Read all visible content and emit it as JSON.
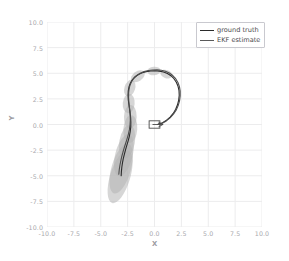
{
  "chart_data": {
    "type": "line",
    "title": "",
    "xlabel": "X",
    "ylabel": "Y",
    "xlim": [
      -10.0,
      10.0
    ],
    "ylim": [
      -10.0,
      10.0
    ],
    "xticks": [
      "-10.0",
      "-7.5",
      "-5.0",
      "-2.5",
      "0.0",
      "2.5",
      "5.0",
      "7.5",
      "10.0"
    ],
    "xtick_values": [
      -10.0,
      -7.5,
      -5.0,
      -2.5,
      0.0,
      2.5,
      5.0,
      7.5,
      10.0
    ],
    "yticks": [
      "10.0",
      "7.5",
      "5.0",
      "2.5",
      "0.0",
      "-2.5",
      "-5.0",
      "-7.5",
      "-10.0"
    ],
    "ytick_values": [
      10.0,
      7.5,
      5.0,
      2.5,
      0.0,
      -2.5,
      -5.0,
      -7.5,
      -10.0
    ],
    "grid": true,
    "grid_color": "#ececed",
    "background": "#ffffff",
    "legend_position": "upper right",
    "series": [
      {
        "name": "ground truth",
        "color": "#2b2b2b",
        "linewidth": 1.1,
        "points": [
          [
            0.35,
            0.05
          ],
          [
            0.75,
            0.18
          ],
          [
            1.12,
            0.42
          ],
          [
            1.45,
            0.72
          ],
          [
            1.74,
            1.08
          ],
          [
            1.97,
            1.48
          ],
          [
            2.14,
            1.92
          ],
          [
            2.25,
            2.38
          ],
          [
            2.3,
            2.85
          ],
          [
            2.28,
            3.3
          ],
          [
            2.19,
            3.73
          ],
          [
            2.03,
            4.12
          ],
          [
            1.81,
            4.47
          ],
          [
            1.53,
            4.76
          ],
          [
            1.2,
            4.98
          ],
          [
            0.84,
            5.13
          ],
          [
            0.45,
            5.21
          ],
          [
            0.05,
            5.24
          ],
          [
            -0.36,
            5.22
          ],
          [
            -0.76,
            5.16
          ],
          [
            -1.14,
            5.05
          ],
          [
            -1.49,
            4.88
          ],
          [
            -1.8,
            4.66
          ],
          [
            -2.05,
            4.38
          ],
          [
            -2.24,
            4.05
          ],
          [
            -2.37,
            3.68
          ],
          [
            -2.44,
            3.28
          ],
          [
            -2.46,
            2.86
          ],
          [
            -2.44,
            2.43
          ],
          [
            -2.39,
            2.0
          ],
          [
            -2.33,
            1.57
          ],
          [
            -2.27,
            1.13
          ],
          [
            -2.22,
            0.68
          ],
          [
            -2.2,
            0.22
          ],
          [
            -2.21,
            -0.24
          ],
          [
            -2.26,
            -0.7
          ],
          [
            -2.34,
            -1.15
          ],
          [
            -2.45,
            -1.59
          ],
          [
            -2.57,
            -2.02
          ],
          [
            -2.69,
            -2.45
          ],
          [
            -2.8,
            -2.88
          ],
          [
            -2.9,
            -3.31
          ],
          [
            -2.98,
            -3.74
          ],
          [
            -3.04,
            -4.17
          ],
          [
            -3.08,
            -4.6
          ],
          [
            -3.1,
            -5.0
          ]
        ]
      },
      {
        "name": "EKF estimate",
        "color": "#4d4d4d",
        "linewidth": 1.1,
        "points": [
          [
            0.3,
            0.0
          ],
          [
            0.72,
            0.12
          ],
          [
            1.1,
            0.35
          ],
          [
            1.45,
            0.65
          ],
          [
            1.76,
            1.0
          ],
          [
            2.01,
            1.4
          ],
          [
            2.2,
            1.84
          ],
          [
            2.33,
            2.31
          ],
          [
            2.39,
            2.79
          ],
          [
            2.39,
            3.25
          ],
          [
            2.32,
            3.69
          ],
          [
            2.18,
            4.1
          ],
          [
            1.97,
            4.47
          ],
          [
            1.7,
            4.78
          ],
          [
            1.38,
            5.02
          ],
          [
            1.02,
            5.19
          ],
          [
            0.63,
            5.29
          ],
          [
            0.23,
            5.33
          ],
          [
            -0.18,
            5.32
          ],
          [
            -0.58,
            5.27
          ],
          [
            -0.97,
            5.16
          ],
          [
            -1.33,
            5.0
          ],
          [
            -1.65,
            4.78
          ],
          [
            -1.92,
            4.51
          ],
          [
            -2.13,
            4.19
          ],
          [
            -2.28,
            3.83
          ],
          [
            -2.37,
            3.44
          ],
          [
            -2.41,
            3.03
          ],
          [
            -2.41,
            2.6
          ],
          [
            -2.38,
            2.17
          ],
          [
            -2.34,
            1.74
          ],
          [
            -2.29,
            1.3
          ],
          [
            -2.26,
            0.85
          ],
          [
            -2.25,
            0.39
          ],
          [
            -2.28,
            -0.07
          ],
          [
            -2.34,
            -0.53
          ],
          [
            -2.44,
            -0.98
          ],
          [
            -2.56,
            -1.42
          ],
          [
            -2.69,
            -1.85
          ],
          [
            -2.82,
            -2.28
          ],
          [
            -2.94,
            -2.71
          ],
          [
            -3.05,
            -3.14
          ],
          [
            -3.14,
            -3.57
          ],
          [
            -3.22,
            -4.0
          ],
          [
            -3.28,
            -4.43
          ],
          [
            -3.32,
            -4.85
          ]
        ]
      }
    ],
    "uncertainty_ellipses": {
      "color": "#b4b4b4",
      "opacity": 0.55,
      "items": [
        {
          "cx": 1.1,
          "cy": 4.92,
          "rx": 0.58,
          "ry": 0.4,
          "angle": -20
        },
        {
          "cx": -0.05,
          "cy": 5.22,
          "rx": 0.62,
          "ry": 0.42,
          "angle": 5
        },
        {
          "cx": -1.55,
          "cy": 4.7,
          "rx": 0.72,
          "ry": 0.48,
          "angle": 35
        },
        {
          "cx": -2.3,
          "cy": 3.55,
          "rx": 0.8,
          "ry": 0.52,
          "angle": 72
        },
        {
          "cx": -2.4,
          "cy": 2.05,
          "rx": 0.92,
          "ry": 0.58,
          "angle": 85
        },
        {
          "cx": -2.25,
          "cy": 0.75,
          "rx": 1.1,
          "ry": 0.62,
          "angle": 88
        },
        {
          "cx": -2.25,
          "cy": -0.45,
          "rx": 1.3,
          "ry": 0.68,
          "angle": 86
        },
        {
          "cx": -2.55,
          "cy": -1.7,
          "rx": 1.6,
          "ry": 0.76,
          "angle": 80
        },
        {
          "cx": -2.85,
          "cy": -3.0,
          "rx": 2.0,
          "ry": 0.85,
          "angle": 76
        },
        {
          "cx": -3.1,
          "cy": -4.3,
          "rx": 2.4,
          "ry": 0.95,
          "angle": 74
        },
        {
          "cx": -3.2,
          "cy": -5.1,
          "rx": 2.55,
          "ry": 0.98,
          "angle": 73
        }
      ]
    },
    "robot_marker": {
      "x": 0.0,
      "y": 0.0,
      "width": 1.0,
      "height": 0.72,
      "heading_deg": 0,
      "color": "#4a4a4a"
    }
  },
  "legend": {
    "entries": [
      {
        "label": "ground truth",
        "color": "#2b2b2b"
      },
      {
        "label": "EKF estimate",
        "color": "#5a5a5a"
      }
    ]
  }
}
